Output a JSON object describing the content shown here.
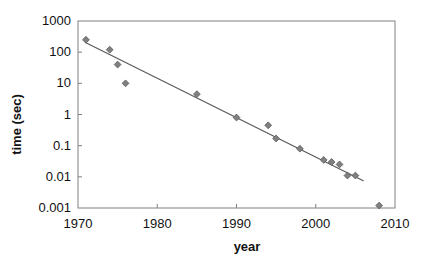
{
  "chart_data": {
    "type": "scatter",
    "title": "",
    "xlabel": "year",
    "ylabel": "time (sec)",
    "xlim": [
      1970,
      2010
    ],
    "ylim": [
      0.001,
      1000
    ],
    "yscale": "log",
    "xscale": "linear",
    "grid": false,
    "legend": null,
    "xticks": [
      1970,
      1980,
      1990,
      2000,
      2010
    ],
    "xtick_labels": [
      "1970",
      "1980",
      "1990",
      "2000",
      "2010"
    ],
    "yticks": [
      0.001,
      0.01,
      0.1,
      1,
      10,
      100,
      1000
    ],
    "ytick_labels": [
      "0.001",
      "0.01",
      "0.1",
      "1",
      "10",
      "100",
      "1000"
    ],
    "marker": "diamond",
    "marker_color": "#808080",
    "marker_edge_color": "#595959",
    "line_color": "#595959",
    "axis_color": "#808080",
    "series": [
      {
        "name": "time",
        "x": [
          1971,
          1974,
          1975,
          1976,
          1985,
          1990,
          1994,
          1995,
          1998,
          2001,
          2002,
          2003,
          2004,
          2005,
          2008
        ],
        "y": [
          250,
          120,
          40,
          10,
          4.5,
          0.8,
          0.45,
          0.17,
          0.08,
          0.035,
          0.03,
          0.025,
          0.011,
          0.011,
          0.0012
        ]
      }
    ],
    "trendline": {
      "name": "log-linear fit",
      "x": [
        1971,
        2006
      ],
      "y": [
        200,
        0.0075
      ]
    }
  }
}
